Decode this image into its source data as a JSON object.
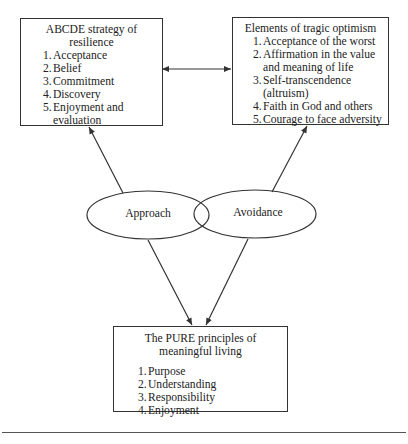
{
  "diagram": {
    "left_box": {
      "title": "ABCDE strategy of resilience",
      "items": [
        {
          "num": "1.",
          "text": "Acceptance"
        },
        {
          "num": "2.",
          "text": "Belief"
        },
        {
          "num": "3.",
          "text": "Commitment"
        },
        {
          "num": "4.",
          "text": "Discovery"
        },
        {
          "num": "5.",
          "text": "Enjoyment and evaluation"
        }
      ]
    },
    "right_box": {
      "title": "Elements of tragic optimism",
      "items": [
        {
          "num": "1.",
          "text": "Acceptance of the worst"
        },
        {
          "num": "2.",
          "text": "Affirmation in the value and meaning of life"
        },
        {
          "num": "3.",
          "text": "Self-transcendence (altruism)"
        },
        {
          "num": "4.",
          "text": "Faith in God and others"
        },
        {
          "num": "5.",
          "text": "Courage to face adversity"
        }
      ]
    },
    "ellipses": {
      "approach": "Approach",
      "avoidance": "Avoidance"
    },
    "bottom_box": {
      "title": "The PURE principles of meaningful living",
      "items": [
        {
          "num": "1.",
          "text": "Purpose"
        },
        {
          "num": "2.",
          "text": "Understanding"
        },
        {
          "num": "3.",
          "text": "Responsibility"
        },
        {
          "num": "4.",
          "text": "Enjoyment"
        }
      ]
    },
    "colors": {
      "stroke": "#333333",
      "background": "#ffffff",
      "text": "#222222"
    }
  }
}
